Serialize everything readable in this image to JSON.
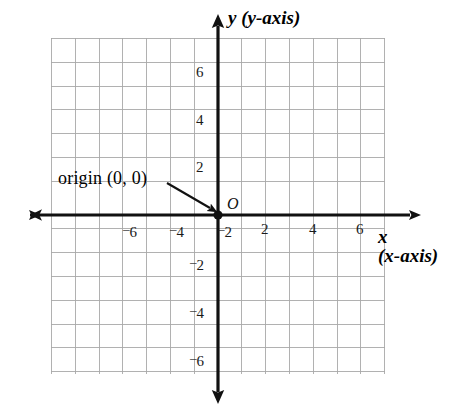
{
  "figure": {
    "kind": "coordinate-plane",
    "background_color": "#ffffff",
    "grid_color": "#9a9a9a",
    "grid_minor_color": "#b9b9b9",
    "axis_color": "#000000",
    "text_color": "#000000"
  },
  "labels": {
    "y_axis": {
      "symbol": "y",
      "paren": "(y-axis)"
    },
    "x_axis": {
      "symbol": "x",
      "paren": "(x-axis)"
    },
    "origin_callout": "origin (0, 0)",
    "origin_point": "O"
  },
  "chart_data": {
    "type": "scatter",
    "title": "",
    "xlabel": "x (x-axis)",
    "ylabel": "y (y-axis)",
    "xlim": [
      -7,
      7
    ],
    "ylim": [
      -6.7,
      6
    ],
    "grid": true,
    "legend": "none",
    "x_ticks": [
      -6,
      -4,
      -2,
      2,
      4,
      6
    ],
    "x_tick_labels": [
      "¯6",
      "¯4",
      "¯2",
      "2",
      "4",
      "6"
    ],
    "y_ticks": [
      6,
      4,
      2,
      -2,
      -4,
      -6
    ],
    "y_tick_labels": [
      "6",
      "4",
      "2",
      "¯2",
      "¯4",
      "¯6"
    ],
    "minor_tick_step": 1,
    "points": [
      {
        "label": "O",
        "x": 0,
        "y": 0,
        "name": "origin"
      }
    ],
    "annotations": [
      {
        "text": "origin (0, 0)",
        "points_to_x": 0,
        "points_to_y": 0,
        "arrow": true
      }
    ]
  },
  "x_tick_items": [
    {
      "id": "xm6",
      "sign": "–",
      "value": "6",
      "px": 123,
      "py": 222
    },
    {
      "id": "xm4",
      "sign": "–",
      "value": "4",
      "px": 170,
      "py": 222
    },
    {
      "id": "xm2",
      "sign": "–",
      "value": "2",
      "px": 218,
      "py": 222
    },
    {
      "id": "xp2",
      "sign": "",
      "value": "2",
      "px": 261,
      "py": 222
    },
    {
      "id": "xp4",
      "sign": "",
      "value": "4",
      "px": 309,
      "py": 222
    },
    {
      "id": "xp6",
      "sign": "",
      "value": "6",
      "px": 356,
      "py": 222
    }
  ],
  "y_tick_items": [
    {
      "id": "yp6",
      "sign": "",
      "value": "6",
      "px": 196,
      "py": 65
    },
    {
      "id": "yp4",
      "sign": "",
      "value": "4",
      "px": 196,
      "py": 113
    },
    {
      "id": "yp2",
      "sign": "",
      "value": "2",
      "px": 196,
      "py": 160
    },
    {
      "id": "ym2",
      "sign": "–",
      "value": "2",
      "px": 190,
      "py": 255
    },
    {
      "id": "ym4",
      "sign": "–",
      "value": "4",
      "px": 190,
      "py": 303
    },
    {
      "id": "ym6",
      "sign": "–",
      "value": "6",
      "px": 190,
      "py": 351
    }
  ]
}
